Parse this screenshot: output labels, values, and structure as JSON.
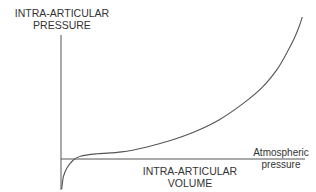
{
  "chart_data": {
    "type": "line",
    "title": "",
    "ylabel": [
      "INTRA-ARTICULAR",
      "PRESSURE"
    ],
    "xlabel": [
      "INTRA-ARTICULAR",
      "VOLUME"
    ],
    "reference_line": {
      "label": [
        "Atmospheric",
        "pressure"
      ],
      "y": 0
    },
    "grid": false,
    "xlim": [
      0,
      100
    ],
    "ylim": [
      -12,
      60
    ],
    "series": [
      {
        "name": "pressure-volume curve",
        "points": [
          [
            0.3,
            -12
          ],
          [
            1,
            -7
          ],
          [
            2.5,
            -3.5
          ],
          [
            5,
            -0.5
          ],
          [
            8,
            1.2
          ],
          [
            15,
            2.2
          ],
          [
            25,
            3.0
          ],
          [
            35,
            5.0
          ],
          [
            45,
            7.8
          ],
          [
            55,
            11.5
          ],
          [
            65,
            16.5
          ],
          [
            75,
            23.5
          ],
          [
            83,
            30.5
          ],
          [
            89,
            38
          ],
          [
            93,
            45
          ],
          [
            96,
            51
          ],
          [
            98,
            56
          ],
          [
            99.3,
            60
          ]
        ]
      }
    ],
    "color": "#555555"
  }
}
